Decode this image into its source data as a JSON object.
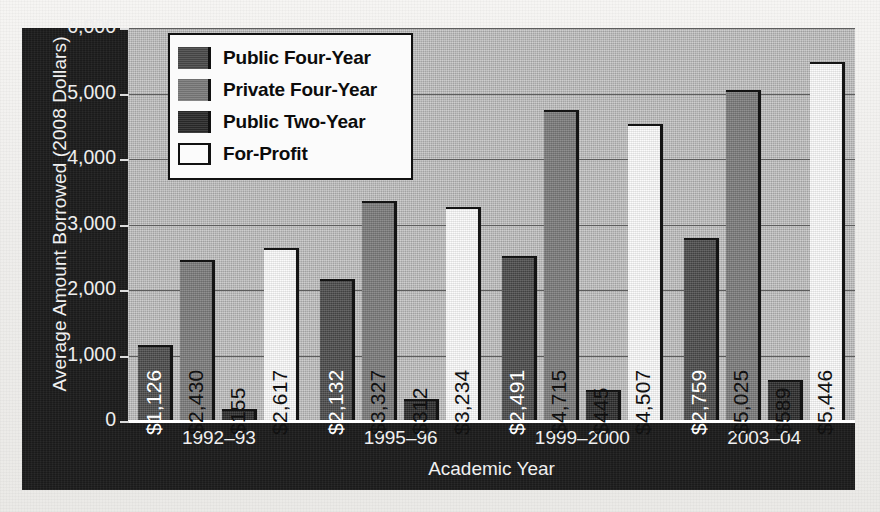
{
  "chart_data": {
    "type": "bar",
    "title": "",
    "xlabel": "Academic Year",
    "ylabel": "Average Amount Borrowed (2008 Dollars)",
    "categories": [
      "1992–93",
      "1995–96",
      "1999–2000",
      "2003–04"
    ],
    "series": [
      {
        "name": "Public Four-Year",
        "color": "#4a4a4a",
        "values": [
          1126,
          2132,
          2491,
          2759
        ],
        "labels": [
          "$1,126",
          "$2,132",
          "$2,491",
          "$2,759"
        ],
        "label_color": "#ffffff"
      },
      {
        "name": "Private Four-Year",
        "color": "#7a7a7a",
        "values": [
          2430,
          3327,
          4715,
          5025
        ],
        "labels": [
          "$2,430",
          "$3,327",
          "$4,715",
          "$5,025"
        ],
        "label_color": "#111111"
      },
      {
        "name": "Public Two-Year",
        "color": "#2a2a2a",
        "values": [
          155,
          312,
          445,
          589
        ],
        "labels": [
          "$155",
          "$312",
          "$445",
          "$589"
        ],
        "label_color": "#111111"
      },
      {
        "name": "For-Profit",
        "color": "#fbfbfb",
        "values": [
          2617,
          3234,
          4507,
          5446
        ],
        "labels": [
          "$2,617",
          "$3,234",
          "$4,507",
          "$5,446"
        ],
        "label_color": "#111111"
      }
    ],
    "ylim": [
      0,
      6000
    ],
    "ytick_labels": [
      "0",
      "1,000",
      "2,000",
      "3,000",
      "4,000",
      "5,000",
      "6,000"
    ],
    "ytick_values": [
      0,
      1000,
      2000,
      3000,
      4000,
      5000,
      6000
    ],
    "grid": true,
    "legend_position": "top-left",
    "legend_entries": [
      "Public Four-Year",
      "Private Four-Year",
      "Public Two-Year",
      "For-Profit"
    ],
    "plot_background": "#b2b2b2",
    "frame_background": "#1b1b1b",
    "axis_text_color": "#f0f0f0"
  }
}
